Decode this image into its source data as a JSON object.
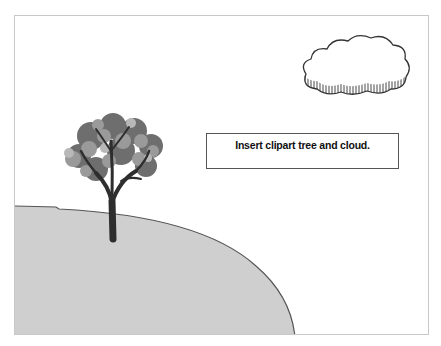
{
  "slide": {
    "textbox": {
      "text": "Insert clipart tree and cloud."
    }
  },
  "colors": {
    "background": "#ffffff",
    "hill_fill": "#cfcfcf",
    "hill_stroke": "#555555",
    "frame_border": "#c8c8c8",
    "trunk": "#2e2e2e"
  },
  "clipart": [
    "tree",
    "cloud",
    "hill"
  ]
}
